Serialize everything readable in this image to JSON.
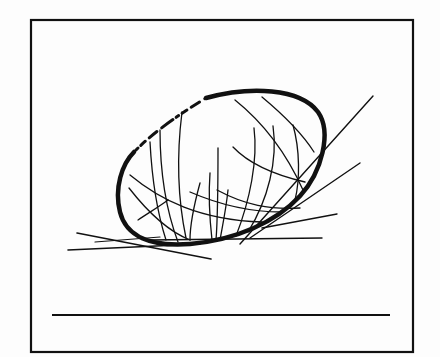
{
  "figure": {
    "description": "Line drawing of a tilted ellipse (egg/cocoon shape) with crossing curved lines, resting on tangent lines, inside a rectangular frame with a horizontal underline below",
    "colors": {
      "ink": "#111111",
      "background": "#fdfdfd"
    },
    "frame": {
      "x": 31,
      "y": 20,
      "width": 382,
      "height": 332
    },
    "underline": {
      "x1": 52,
      "y1": 315,
      "x2": 390,
      "y2": 315
    }
  }
}
